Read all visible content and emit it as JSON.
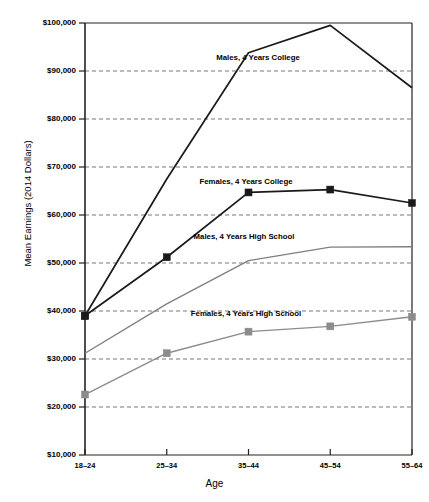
{
  "chart_data": {
    "type": "line",
    "title": "",
    "xlabel": "Age",
    "ylabel": "Mean Earnings (2014 Dollars)",
    "categories": [
      "18–24",
      "25–34",
      "35–44",
      "45–54",
      "55–64"
    ],
    "ylim": [
      10000,
      100000
    ],
    "ytick_labels": [
      "$100,000",
      "$90,000",
      "$80,000",
      "$70,000",
      "$60,000",
      "$50,000",
      "$40,000",
      "$30,000",
      "$20,000",
      "$10,000"
    ],
    "ytick_values": [
      100000,
      90000,
      80000,
      70000,
      60000,
      50000,
      40000,
      30000,
      20000,
      10000
    ],
    "grid": "horizontal-dashed",
    "legend": "inline-annotations",
    "series": [
      {
        "name": "Males, 4 Years College",
        "color": "#1a1a1a",
        "marker": "square",
        "markers_shown": [
          true,
          false,
          false,
          false,
          false
        ],
        "values": [
          39000,
          67500,
          93800,
          99500,
          86500
        ],
        "annotation": "Males, 4 Years College",
        "annotation_x": 258,
        "annotation_y": 53
      },
      {
        "name": "Females, 4 Years College",
        "color": "#1a1a1a",
        "marker": "square",
        "markers_shown": [
          true,
          true,
          true,
          true,
          true
        ],
        "values": [
          39000,
          51200,
          64700,
          65300,
          62500
        ],
        "annotation": "Females, 4 Years College",
        "annotation_x": 246,
        "annotation_y": 177
      },
      {
        "name": "Males, 4 Years High School",
        "color": "#808080",
        "marker": "none",
        "markers_shown": [
          false,
          false,
          false,
          false,
          false
        ],
        "values": [
          31200,
          41500,
          50500,
          53300,
          53400
        ],
        "annotation": "Males, 4 Years High School",
        "annotation_x": 244,
        "annotation_y": 232
      },
      {
        "name": "Females, 4 Years High School",
        "color": "#8c8c8c",
        "marker": "square",
        "markers_shown": [
          true,
          true,
          true,
          true,
          true
        ],
        "values": [
          22600,
          31200,
          35700,
          36800,
          38800
        ],
        "annotation": "Females, 4 Years High School",
        "annotation_x": 246,
        "annotation_y": 309
      }
    ]
  }
}
